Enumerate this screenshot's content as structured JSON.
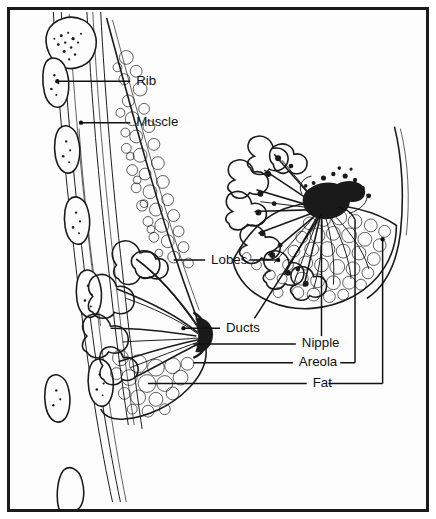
{
  "figure": {
    "background_color": "#fdfdfd",
    "border_color": "#1b1b1b",
    "ink_color": "#1a1a1a",
    "views": [
      {
        "name": "lateral-cross-section",
        "position": "left",
        "description": "Side cut-away view through chest wall and breast"
      },
      {
        "name": "frontal-cutaway",
        "position": "right",
        "description": "Front view with tissue cut away showing radiating ducts and lobes"
      }
    ]
  },
  "labels": [
    {
      "id": "rib",
      "text": "Rib",
      "x": 128,
      "y": 72,
      "leader": "left"
    },
    {
      "id": "muscle",
      "text": "Muscle",
      "x": 128,
      "y": 114,
      "leader": "left"
    },
    {
      "id": "lobes",
      "text": "Lobes",
      "x": 204,
      "y": 253,
      "leader": "both"
    },
    {
      "id": "ducts",
      "text": "Ducts",
      "x": 219,
      "y": 322,
      "leader": "left"
    },
    {
      "id": "nipple",
      "text": "Nipple",
      "x": 296,
      "y": 338,
      "leader": "left"
    },
    {
      "id": "areola",
      "text": "Areola",
      "x": 293,
      "y": 357,
      "leader": "both"
    },
    {
      "id": "fat",
      "text": "Fat",
      "x": 307,
      "y": 378,
      "leader": "both"
    }
  ]
}
